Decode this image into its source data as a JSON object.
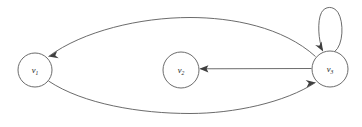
{
  "figure": {
    "type": "directed-graph",
    "background_color": "#ffffff",
    "edge_color": "#5a5a5a",
    "arrow_color": "#3f3f3f",
    "node_fill": "#ffffff",
    "node_stroke": "#5a5a5a",
    "label_color": "#1a1a1a"
  },
  "nodes": [
    {
      "id": "v1",
      "label_base": "v",
      "label_sub": "1",
      "cx": 35,
      "cy": 70,
      "r": 17
    },
    {
      "id": "v2",
      "label_base": "v",
      "label_sub": "2",
      "cx": 181,
      "cy": 70,
      "r": 18
    },
    {
      "id": "v3",
      "label_base": "v",
      "label_sub": "3",
      "cx": 330,
      "cy": 69,
      "r": 18
    }
  ],
  "edges": [
    {
      "id": "e-v3-v1",
      "from": "v3",
      "to": "v1",
      "shape": "arc-top",
      "directed": true,
      "label": ""
    },
    {
      "id": "e-v1-v3",
      "from": "v1",
      "to": "v3",
      "shape": "arc-bottom",
      "directed": true,
      "label": ""
    },
    {
      "id": "e-v3-v2",
      "from": "v3",
      "to": "v2",
      "shape": "straight",
      "directed": true,
      "label": ""
    },
    {
      "id": "e-v3-v3",
      "from": "v3",
      "to": "v3",
      "shape": "self-loop-top",
      "directed": true,
      "label": ""
    }
  ]
}
